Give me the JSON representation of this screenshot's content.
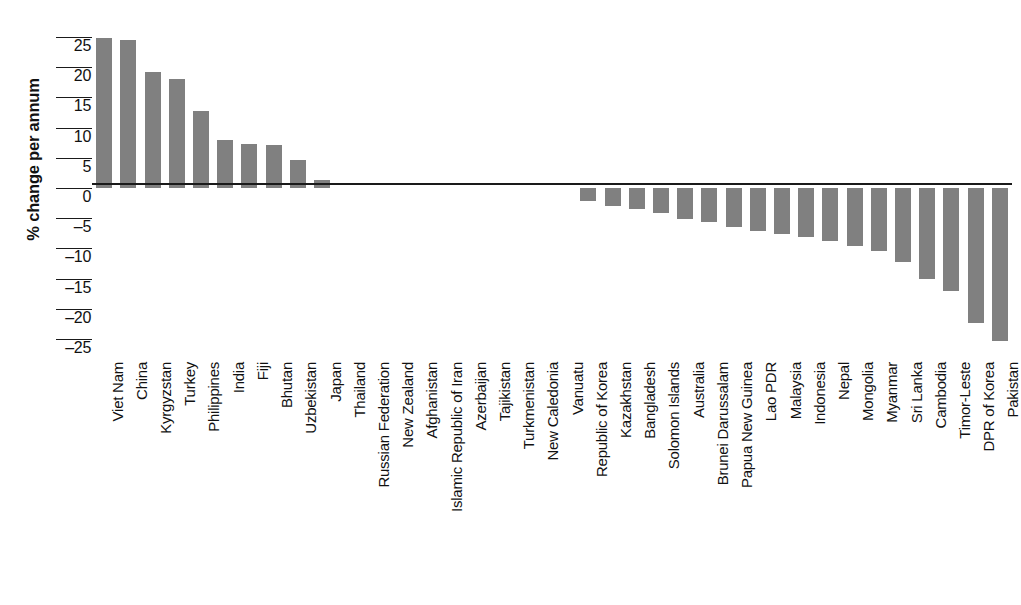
{
  "chart_data": {
    "type": "bar",
    "title": "",
    "xlabel": "",
    "ylabel": "% change per annum",
    "ylim": [
      -27.5,
      27.5
    ],
    "yticks": [
      25,
      20,
      15,
      10,
      5,
      0,
      -5,
      -10,
      -15,
      -20,
      -25
    ],
    "ytick_labels": [
      "25",
      "20",
      "15",
      "10",
      "5",
      "0",
      "–5",
      "–10",
      "–15",
      "–20",
      "–25"
    ],
    "grid": false,
    "legend": null,
    "bar_color": "#808080",
    "axis_color": "#1a1a1a",
    "categories": [
      "Viet Nam",
      "China",
      "Kyrgyzstan",
      "Turkey",
      "Philippines",
      "India",
      "Fiji",
      "Bhutan",
      "Uzbekistan",
      "Japan",
      "Thailand",
      "Russian Federation",
      "New Zealand",
      "Afghanistan",
      "Islamic Republic of Iran",
      "Azerbaijan",
      "Tajikistan",
      "Turkmenistan",
      "New Caledonia",
      "Vanuatu",
      "Republic of Korea",
      "Kazakhstan",
      "Bangladesh",
      "Solomon Islands",
      "Australia",
      "Brunei Darussalam",
      "Papua New Guinea",
      "Lao PDR",
      "Malaysia",
      "Indonesia",
      "Nepal",
      "Mongolia",
      "Myanmar",
      "Sri Lanka",
      "Cambodia",
      "Timor-Leste",
      "DPR of Korea",
      "Pakistan"
    ],
    "values": [
      24.8,
      24.6,
      19.2,
      18.1,
      12.7,
      8.0,
      7.3,
      7.2,
      4.6,
      1.4,
      0.0,
      0.0,
      0.0,
      0.0,
      0.0,
      0.0,
      0.0,
      0.0,
      0.0,
      0.0,
      -2.1,
      -3.0,
      -3.4,
      -4.2,
      -5.2,
      -5.6,
      -6.4,
      -7.2,
      -7.6,
      -8.2,
      -8.7,
      -9.6,
      -10.5,
      -12.2,
      -15.1,
      -17.0,
      -22.4,
      -25.4
    ]
  }
}
